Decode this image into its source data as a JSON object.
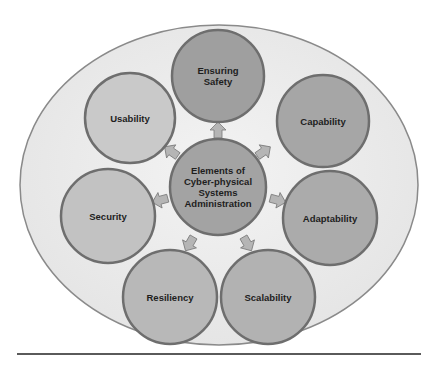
{
  "diagram": {
    "center": {
      "label": "Elements of Cyber-physical Systems Administration",
      "lines": [
        "Elements of",
        "Cyber-physical",
        "Systems",
        "Administration"
      ],
      "cx": 218,
      "cy": 187,
      "r": 48,
      "fill": "#a3a3a3"
    },
    "container": {
      "cx": 219,
      "cy": 185,
      "rx": 199,
      "ry": 160,
      "fill": "#ececec",
      "stroke": "#8a8a8a"
    },
    "nodes": [
      {
        "id": "ensuring-safety",
        "label": "Ensuring Safety",
        "lines": [
          "Ensuring",
          "Safety"
        ],
        "cx": 218,
        "cy": 76,
        "r": 46,
        "fill": "#9f9f9f"
      },
      {
        "id": "capability",
        "label": "Capability",
        "lines": [
          "Capability"
        ],
        "cx": 323,
        "cy": 121,
        "r": 46,
        "fill": "#a6a6a6"
      },
      {
        "id": "adaptability",
        "label": "Adaptability",
        "lines": [
          "Adaptability"
        ],
        "cx": 330,
        "cy": 218,
        "r": 47,
        "fill": "#ababab"
      },
      {
        "id": "scalability",
        "label": "Scalability",
        "lines": [
          "Scalability"
        ],
        "cx": 268,
        "cy": 297,
        "r": 47,
        "fill": "#b2b2b2"
      },
      {
        "id": "resiliency",
        "label": "Resiliency",
        "lines": [
          "Resiliency"
        ],
        "cx": 170,
        "cy": 297,
        "r": 47,
        "fill": "#b8b8b8"
      },
      {
        "id": "security",
        "label": "Security",
        "lines": [
          "Security"
        ],
        "cx": 108,
        "cy": 216,
        "r": 47,
        "fill": "#c2c2c2"
      },
      {
        "id": "usability",
        "label": "Usability",
        "lines": [
          "Usability"
        ],
        "cx": 130,
        "cy": 118,
        "r": 45,
        "fill": "#c9c9c9"
      }
    ],
    "arrows": [
      {
        "target": "ensuring-safety",
        "x": 218,
        "y": 131,
        "angle": -90
      },
      {
        "target": "capability",
        "x": 263,
        "y": 152,
        "angle": -35
      },
      {
        "target": "adaptability",
        "x": 277,
        "y": 200,
        "angle": 15
      },
      {
        "target": "scalability",
        "x": 247,
        "y": 243,
        "angle": 60
      },
      {
        "target": "resiliency",
        "x": 190,
        "y": 243,
        "angle": 120
      },
      {
        "target": "security",
        "x": 161,
        "y": 200,
        "angle": 165
      },
      {
        "target": "usability",
        "x": 172,
        "y": 152,
        "angle": -145
      }
    ],
    "colors": {
      "node_stroke": "#6e6e6e",
      "arrow_fill": "#b5b5b5",
      "arrow_stroke": "#7a7a7a",
      "text": "#1e1e1e",
      "rule": "#5a5a5a"
    }
  }
}
